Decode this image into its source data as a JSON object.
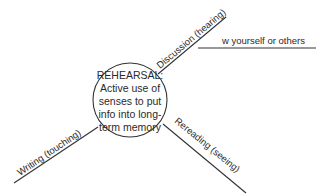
{
  "diagram": {
    "center": {
      "lines": [
        "REHEARSAL:",
        "Active use of",
        "senses to put",
        "info into long-",
        "term memory"
      ]
    },
    "branches": [
      {
        "label": "Discussion (hearing)",
        "sub_branches": [
          {
            "label": "w yourself or others"
          }
        ]
      },
      {
        "label": "Rereading (seeing)"
      },
      {
        "label": "Writing (touching)"
      }
    ]
  }
}
